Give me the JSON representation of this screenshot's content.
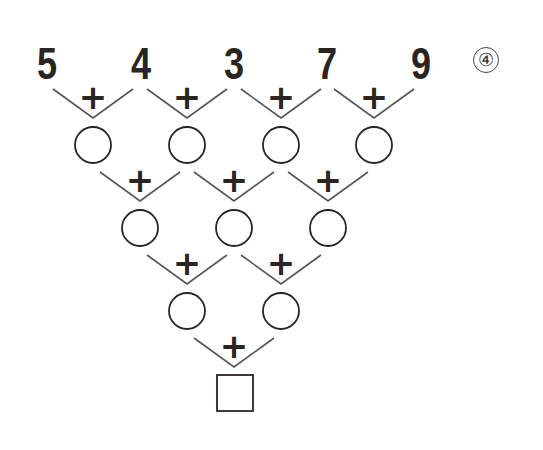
{
  "problem_label": "④",
  "top_numbers": [
    "5",
    "4",
    "3",
    "7",
    "9"
  ],
  "operator": "+",
  "rows": {
    "row1_circles": 4,
    "row2_circles": 3,
    "row3_circles": 2,
    "answer_box": 1
  },
  "colors": {
    "ink": "#2b2522",
    "line": "#555555"
  }
}
